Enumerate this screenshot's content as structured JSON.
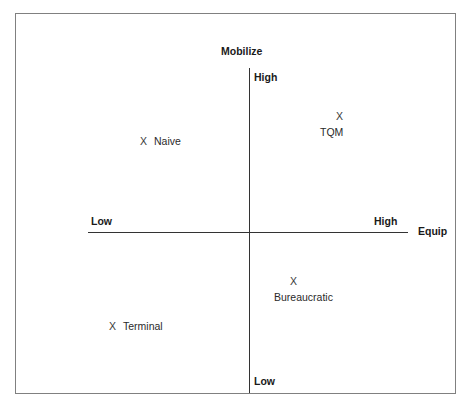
{
  "chart_data": {
    "type": "scatter",
    "title": "",
    "xlabel": "Equip",
    "ylabel": "Mobilize",
    "x_axis": {
      "name": "Equip",
      "low_label": "Low",
      "high_label": "High"
    },
    "y_axis": {
      "name": "Mobilize",
      "low_label": "Low",
      "high_label": "High"
    },
    "grid": false,
    "legend": "none",
    "quadrant_chart": true,
    "categories": [
      "Naive",
      "TQM",
      "Bureaucratic",
      "Terminal"
    ],
    "points": [
      {
        "label": "Naive",
        "marker": "X",
        "layout": "inline",
        "equip": "Low",
        "mobilize": "High",
        "quadrant": "top-left"
      },
      {
        "label": "TQM",
        "marker": "X",
        "layout": "stacked",
        "equip": "High",
        "mobilize": "High",
        "quadrant": "top-right"
      },
      {
        "label": "Bureaucratic",
        "marker": "X",
        "layout": "stacked",
        "equip": "High",
        "mobilize": "Low",
        "quadrant": "bottom-right"
      },
      {
        "label": "Terminal",
        "marker": "X",
        "layout": "inline",
        "equip": "Low",
        "mobilize": "Low",
        "quadrant": "bottom-left"
      }
    ],
    "colors": {
      "frame": "#808080",
      "axis": "#333333",
      "text": "#1a1a1a",
      "background": "#ffffff"
    }
  }
}
